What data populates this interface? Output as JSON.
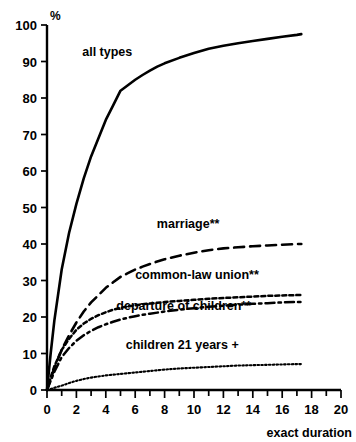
{
  "chart_data": {
    "type": "line",
    "title": "",
    "subtitle": "",
    "xlabel": "exact duration",
    "ylabel": "%",
    "xlim": [
      0,
      20
    ],
    "ylim": [
      0,
      100
    ],
    "grid": false,
    "legend_position": "inline-annotations",
    "x_ticks": [
      "0",
      "2",
      "4",
      "6",
      "8",
      "10",
      "12",
      "14",
      "16",
      "18",
      "20"
    ],
    "x_tick_values": [
      0,
      2,
      4,
      6,
      8,
      10,
      12,
      14,
      16,
      18,
      20
    ],
    "x_minor_tick_values": [
      1,
      3,
      5,
      7,
      9,
      11,
      13,
      15,
      17,
      19
    ],
    "y_ticks": [
      "0",
      "10",
      "20",
      "30",
      "40",
      "50",
      "60",
      "70",
      "80",
      "90",
      "100"
    ],
    "y_tick_values": [
      0,
      10,
      20,
      30,
      40,
      50,
      60,
      70,
      80,
      90,
      100
    ],
    "series": [
      {
        "name": "all types",
        "style": "solid",
        "label": "all types",
        "label_x": 4.1,
        "label_y": 91.5,
        "x": [
          0,
          0.25,
          0.5,
          1,
          1.5,
          2,
          2.5,
          3,
          3.5,
          4,
          4.5,
          5,
          5.5,
          6,
          6.5,
          7,
          7.5,
          8,
          9,
          10,
          11,
          12,
          13,
          14,
          15,
          16,
          17,
          17.3
        ],
        "y": [
          0,
          10,
          19,
          33,
          43,
          51,
          58,
          64,
          69,
          74,
          78,
          82,
          83.5,
          85,
          86.3,
          87.5,
          88.6,
          89.5,
          91,
          92.3,
          93.5,
          94.3,
          95,
          95.6,
          96.2,
          96.8,
          97.3,
          97.5
        ]
      },
      {
        "name": "marriage**",
        "style": "long-dash",
        "label": "marriage**",
        "label_x": 9.6,
        "label_y": 44.5,
        "x": [
          0,
          0.25,
          0.5,
          1,
          1.5,
          2,
          2.5,
          3,
          3.5,
          4,
          4.5,
          5,
          5.5,
          6,
          6.5,
          7,
          7.5,
          8,
          9,
          10,
          11,
          12,
          13,
          14,
          15,
          16,
          17,
          17.3
        ],
        "y": [
          0,
          3,
          6,
          11,
          15,
          18.5,
          21.5,
          24,
          26,
          28,
          29.5,
          31,
          32,
          33,
          33.8,
          34.5,
          35.2,
          35.8,
          36.8,
          37.6,
          38.3,
          38.8,
          39.1,
          39.4,
          39.6,
          39.8,
          40,
          40
        ]
      },
      {
        "name": "common-law union**",
        "style": "fine-dash",
        "label": "common-law union**",
        "label_x": 10.2,
        "label_y": 30.5,
        "x": [
          0,
          0.25,
          0.5,
          1,
          1.5,
          2,
          2.5,
          3,
          3.5,
          4,
          4.5,
          5,
          5.5,
          6,
          6.5,
          7,
          7.5,
          8,
          9,
          10,
          11,
          12,
          13,
          14,
          15,
          16,
          17,
          17.3
        ],
        "y": [
          0,
          3.5,
          6.5,
          11,
          14,
          16.5,
          18.2,
          19.5,
          20.5,
          21.3,
          22,
          22.5,
          22.9,
          23.2,
          23.5,
          23.7,
          23.9,
          24.1,
          24.4,
          24.7,
          25,
          25.2,
          25.4,
          25.6,
          25.8,
          25.9,
          26,
          26
        ]
      },
      {
        "name": "departure of children**",
        "style": "dash-dot",
        "label": "departure of children**",
        "label_x": 9.3,
        "label_y": 21.8,
        "x": [
          0,
          0.25,
          0.5,
          1,
          1.5,
          2,
          2.5,
          3,
          3.5,
          4,
          4.5,
          5,
          5.5,
          6,
          6.5,
          7,
          7.5,
          8,
          9,
          10,
          11,
          12,
          13,
          14,
          15,
          16,
          17,
          17.3
        ],
        "y": [
          0,
          2.5,
          5,
          9,
          11.5,
          13.5,
          15,
          16.2,
          17.2,
          18,
          18.7,
          19.3,
          19.8,
          20.2,
          20.6,
          20.9,
          21.2,
          21.5,
          22,
          22.4,
          22.8,
          23.1,
          23.4,
          23.6,
          23.8,
          24,
          24.1,
          24.1
        ]
      },
      {
        "name": "children 21 years +",
        "style": "dotted",
        "label": "children 21 years +",
        "label_x": 9.2,
        "label_y": 11.2,
        "x": [
          0,
          0.5,
          1,
          1.5,
          2,
          2.5,
          3,
          3.5,
          4,
          4.5,
          5,
          5.5,
          6,
          6.5,
          7,
          7.5,
          8,
          9,
          10,
          11,
          12,
          13,
          14,
          15,
          16,
          17,
          17.3
        ],
        "y": [
          0,
          0.6,
          1.2,
          1.9,
          2.5,
          3,
          3.4,
          3.7,
          4,
          4.2,
          4.4,
          4.6,
          4.8,
          5,
          5.2,
          5.4,
          5.6,
          5.9,
          6.1,
          6.3,
          6.5,
          6.7,
          6.8,
          6.9,
          7,
          7.1,
          7.1
        ]
      }
    ]
  }
}
